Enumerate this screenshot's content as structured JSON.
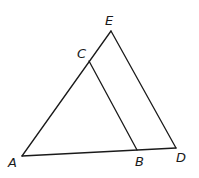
{
  "diagram": {
    "type": "geometry-triangle",
    "points": {
      "A": {
        "label": "A",
        "x": 22,
        "y": 156
      },
      "B": {
        "label": "B",
        "x": 137,
        "y": 150
      },
      "C": {
        "label": "C",
        "x": 89,
        "y": 61
      },
      "D": {
        "label": "D",
        "x": 176,
        "y": 148
      },
      "E": {
        "label": "E",
        "x": 111,
        "y": 31
      }
    },
    "segments": [
      "AE",
      "ED",
      "AD",
      "CB"
    ],
    "labels": {
      "A": "A",
      "B": "B",
      "C": "C",
      "D": "D",
      "E": "E"
    },
    "line_color": "#1a1a1a"
  }
}
